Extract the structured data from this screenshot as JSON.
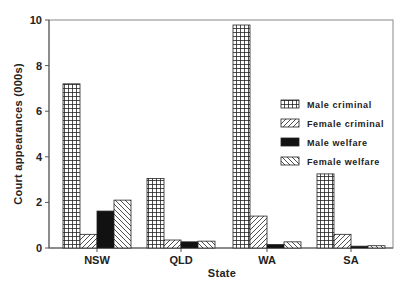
{
  "chart_data": {
    "type": "bar",
    "title": "",
    "xlabel": "State",
    "ylabel": "Court appearances (000s)",
    "ylim": [
      0,
      10
    ],
    "yticks": [
      0,
      2,
      4,
      6,
      8,
      10
    ],
    "grid": false,
    "legend_position": "inside-right",
    "categories": [
      "NSW",
      "QLD",
      "WA",
      "SA"
    ],
    "series": [
      {
        "name": "Male criminal",
        "pattern": "grid",
        "values": [
          7.2,
          3.05,
          9.78,
          3.25
        ]
      },
      {
        "name": "Female criminal",
        "pattern": "diagonal-forward",
        "values": [
          0.6,
          0.35,
          1.4,
          0.6
        ]
      },
      {
        "name": "Male welfare",
        "pattern": "solid-black",
        "values": [
          1.62,
          0.27,
          0.15,
          0.08
        ]
      },
      {
        "name": "Female welfare",
        "pattern": "diagonal-backward",
        "values": [
          2.1,
          0.3,
          0.27,
          0.1
        ]
      }
    ]
  }
}
